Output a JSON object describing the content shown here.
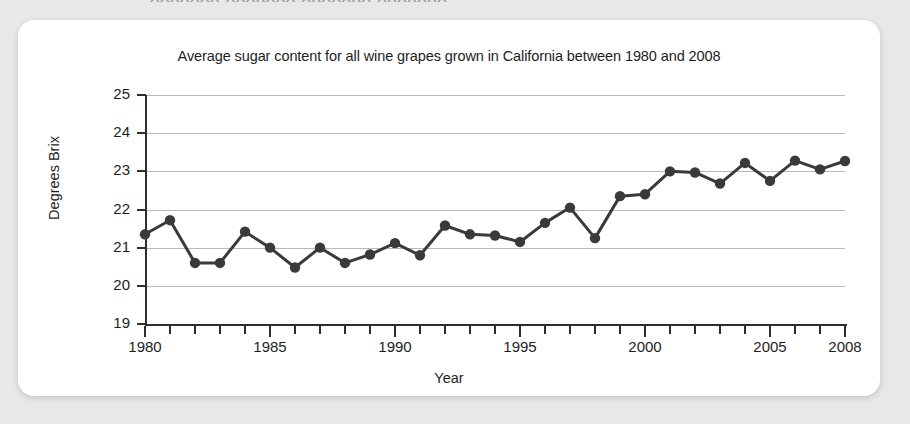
{
  "page": {
    "background_color": "#e8e8e6",
    "card_color": "#ffffff",
    "bleed_text": "xxxxxxx xxxxxxx xxxxxxx xxxxxxx"
  },
  "figure": {
    "title": "Average sugar content for all wine grapes grown in California between 1980 and 2008",
    "line_color": "#3a3a3a",
    "marker_color": "#3a3a3a",
    "grid_color": "#b9b9b9",
    "axis_color": "#2e2e2e"
  },
  "chart_data": {
    "type": "line",
    "title": "Average sugar content for all wine grapes grown in California between 1980 and 2008",
    "xlabel": "Year",
    "ylabel": "Degrees Brix",
    "xlim": [
      1980,
      2008
    ],
    "ylim": [
      19,
      25
    ],
    "grid": true,
    "legend": "none",
    "y_ticks": [
      25,
      24,
      23,
      22,
      21,
      20,
      19
    ],
    "y_tick_labels": [
      "25",
      "24",
      "23",
      "22",
      "21",
      "20",
      "19"
    ],
    "x_ticks": [
      1980,
      1981,
      1982,
      1983,
      1984,
      1985,
      1986,
      1987,
      1988,
      1989,
      1990,
      1991,
      1992,
      1993,
      1994,
      1995,
      1996,
      1997,
      1998,
      1999,
      2000,
      2001,
      2002,
      2003,
      2004,
      2005,
      2006,
      2007,
      2008
    ],
    "x_tick_labels_shown": [
      "1980",
      "1985",
      "1990",
      "1995",
      "2000",
      "2005",
      "2008"
    ],
    "x_tick_labels_shown_values": [
      1980,
      1985,
      1990,
      1995,
      2000,
      2005,
      2008
    ],
    "series": [
      {
        "name": "Average sugar content",
        "marker": "circle",
        "x": [
          1980,
          1981,
          1982,
          1983,
          1984,
          1985,
          1986,
          1987,
          1988,
          1989,
          1990,
          1991,
          1992,
          1993,
          1994,
          1995,
          1996,
          1997,
          1998,
          1999,
          2000,
          2001,
          2002,
          2003,
          2004,
          2005,
          2006,
          2007,
          2008
        ],
        "values": [
          21.35,
          21.72,
          20.6,
          20.6,
          21.42,
          21.0,
          20.48,
          21.0,
          20.6,
          20.82,
          21.12,
          20.8,
          21.58,
          21.35,
          21.32,
          21.15,
          21.65,
          22.05,
          21.25,
          22.35,
          22.4,
          23.0,
          22.97,
          22.68,
          23.22,
          22.75,
          23.28,
          23.05,
          23.27
        ]
      }
    ]
  }
}
